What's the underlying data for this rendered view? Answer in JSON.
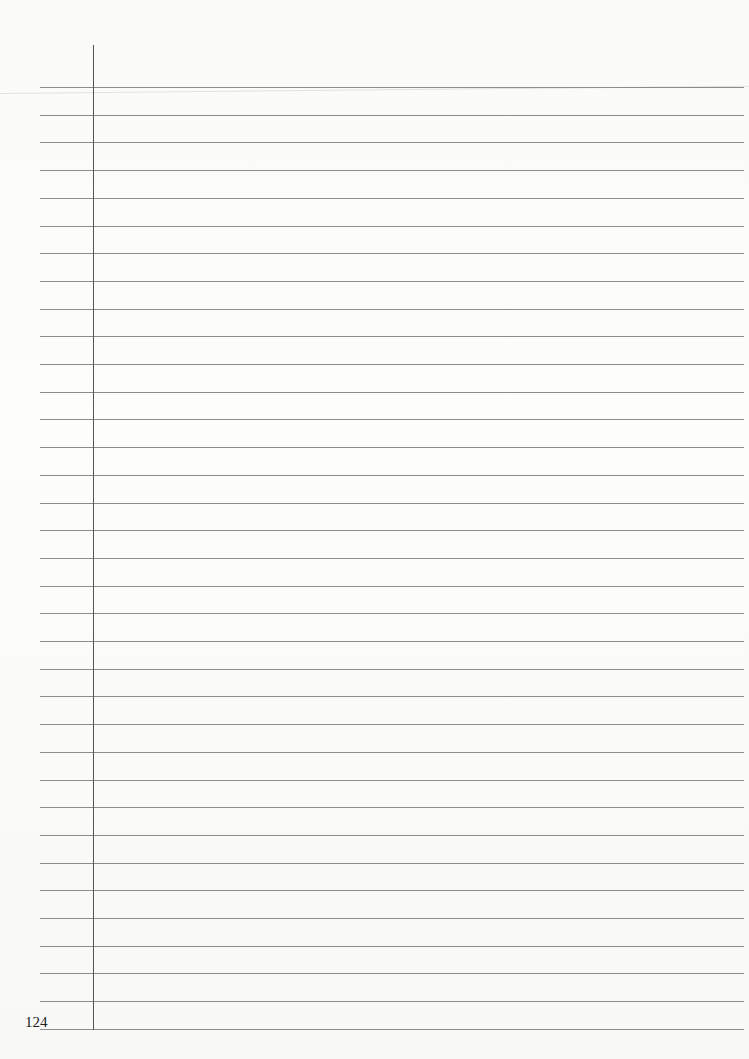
{
  "page": {
    "type": "ruled-notebook-page",
    "page_number": "124",
    "line_count": 35,
    "first_line_y": 87,
    "line_spacing": 27.7,
    "line_color": "#8c8c8c",
    "margin_line_color": "#555555",
    "background_color": "#fbfbfa",
    "content": ""
  }
}
